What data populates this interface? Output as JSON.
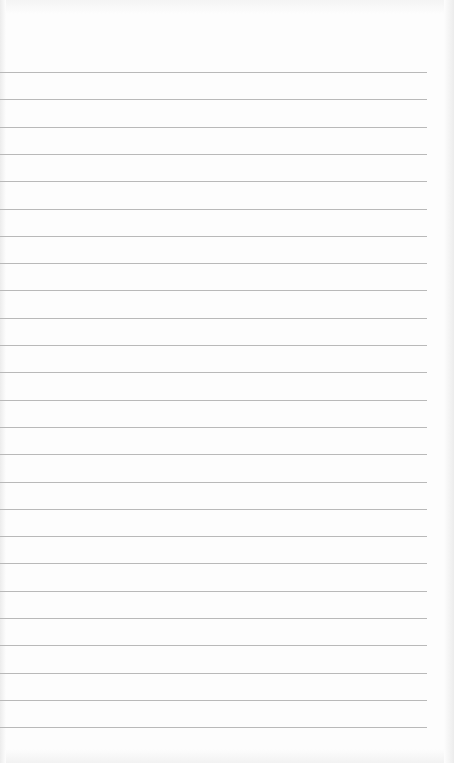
{
  "paper": {
    "type": "lined-paper",
    "line_count": 25,
    "first_line_y": 72,
    "line_spacing": 27.3,
    "line_width": 427,
    "line_color": "#b9b9b9",
    "background_color": "#fdfdfd"
  }
}
